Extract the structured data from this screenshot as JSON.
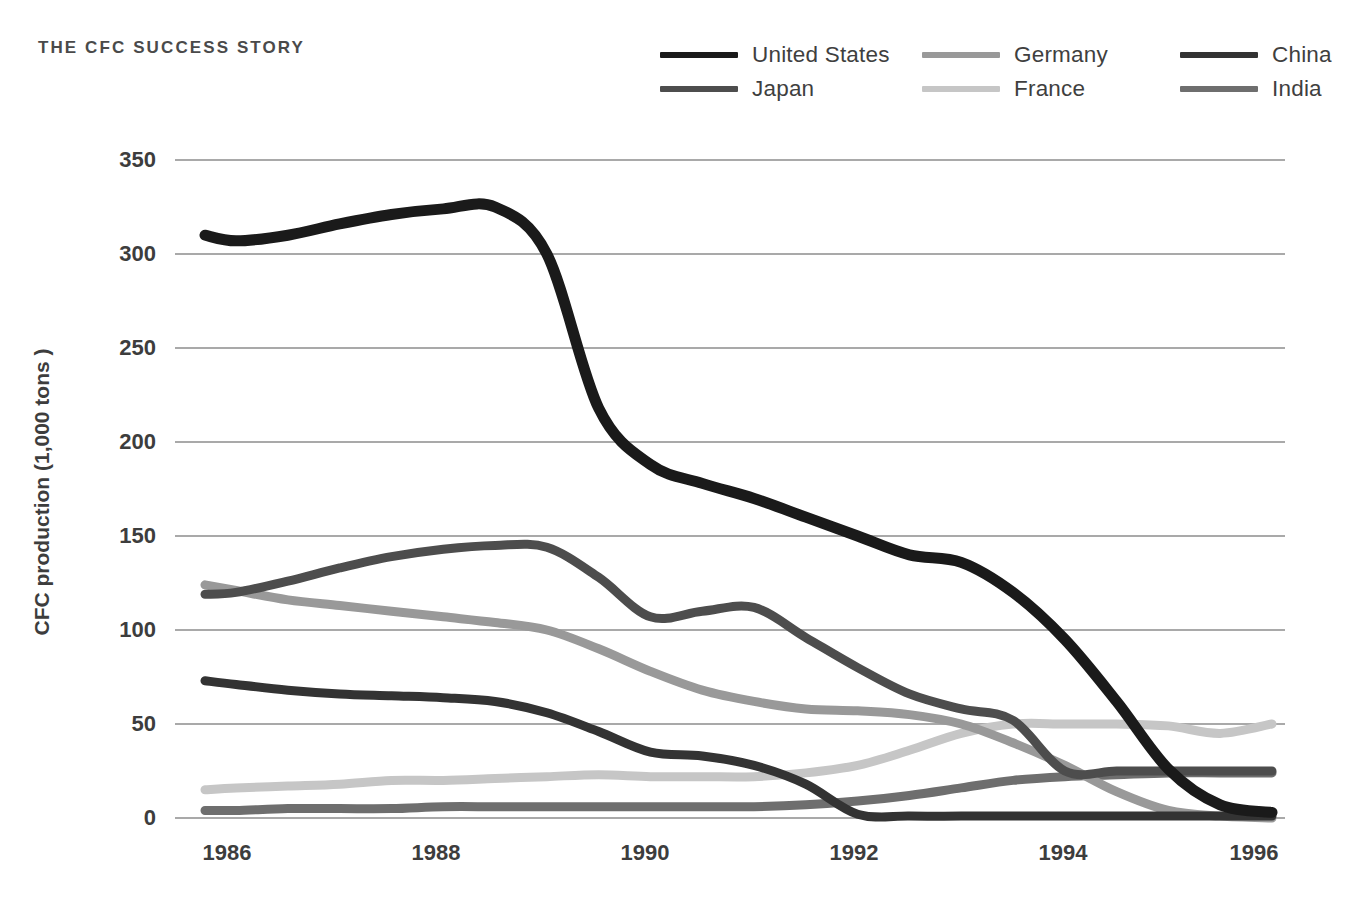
{
  "title": "THE CFC SUCCESS STORY",
  "caption": "",
  "colors": {
    "united_states": "#1a1a1a",
    "japan": "#4d4d4d",
    "germany": "#999999",
    "france": "#c6c6c6",
    "china": "#333333",
    "india": "#6e6e6e",
    "grid": "#8c8c8c",
    "text": "#3d3d3d"
  },
  "legend": {
    "position": "top-right",
    "items": [
      {
        "label": "United States",
        "color": "#1a1a1a"
      },
      {
        "label": "Germany",
        "color": "#999999"
      },
      {
        "label": "China",
        "color": "#333333"
      },
      {
        "label": "Japan",
        "color": "#4d4d4d"
      },
      {
        "label": "France",
        "color": "#c6c6c6"
      },
      {
        "label": "India",
        "color": "#6e6e6e"
      }
    ]
  },
  "axes": {
    "ylabel": "CFC production (1,000 tons )",
    "yticks": [
      "0",
      "50",
      "100",
      "150",
      "200",
      "250",
      "300",
      "350"
    ],
    "xticks": [
      "1986",
      "1988",
      "1990",
      "1992",
      "1994",
      "1996"
    ],
    "xlabel": ""
  },
  "chart_data": {
    "type": "line",
    "title": "THE CFC SUCCESS STORY",
    "xlabel": "",
    "ylabel": "CFC production (1,000 tons )",
    "xlim": [
      1985.7,
      1996.2
    ],
    "ylim": [
      0,
      350
    ],
    "grid": true,
    "legend_position": "top-right",
    "x": [
      1985.7,
      1986,
      1986.5,
      1987,
      1987.5,
      1988,
      1988.5,
      1989,
      1989.5,
      1990,
      1990.5,
      1991,
      1991.5,
      1992,
      1992.5,
      1993,
      1993.5,
      1994,
      1994.5,
      1995,
      1995.5,
      1996
    ],
    "series": [
      {
        "name": "United States",
        "color": "#1a1a1a",
        "values": [
          310,
          307,
          310,
          316,
          321,
          324,
          325,
          300,
          218,
          188,
          178,
          170,
          160,
          150,
          140,
          136,
          120,
          95,
          62,
          26,
          7,
          3
        ]
      },
      {
        "name": "Japan",
        "color": "#4d4d4d",
        "values": [
          119,
          120,
          126,
          133,
          139,
          143,
          145,
          144,
          128,
          107,
          110,
          112,
          96,
          80,
          66,
          58,
          52,
          25,
          25,
          25,
          25,
          25
        ]
      },
      {
        "name": "Germany",
        "color": "#999999",
        "values": [
          124,
          121,
          116,
          113,
          110,
          107,
          104,
          100,
          90,
          78,
          68,
          62,
          58,
          57,
          55,
          50,
          40,
          28,
          14,
          4,
          1,
          0
        ]
      },
      {
        "name": "France",
        "color": "#c6c6c6",
        "values": [
          15,
          16,
          17,
          18,
          20,
          20,
          21,
          22,
          23,
          22,
          22,
          22,
          24,
          28,
          36,
          45,
          50,
          50,
          50,
          49,
          45,
          50
        ]
      },
      {
        "name": "China",
        "color": "#333333",
        "values": [
          73,
          71,
          68,
          66,
          65,
          64,
          62,
          56,
          46,
          35,
          33,
          28,
          18,
          2,
          1,
          1,
          1,
          1,
          1,
          1,
          1,
          1
        ]
      },
      {
        "name": "India",
        "color": "#6e6e6e",
        "values": [
          4,
          4,
          5,
          5,
          5,
          6,
          6,
          6,
          6,
          6,
          6,
          6,
          7,
          9,
          12,
          16,
          20,
          22,
          23,
          24,
          24,
          24
        ]
      }
    ]
  }
}
